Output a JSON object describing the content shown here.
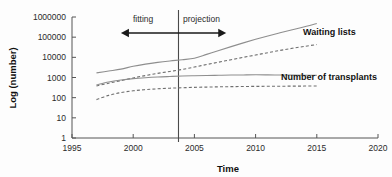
{
  "chart_data": {
    "type": "line",
    "title": "",
    "xlabel": "Time",
    "ylabel": "Log (number)",
    "xlim": [
      1995,
      2020
    ],
    "ylim": [
      1,
      1000000
    ],
    "yscale": "log",
    "grid": false,
    "legend_position": "inline-right",
    "xticks": [
      "1995",
      "2000",
      "2005",
      "2010",
      "2015",
      "2020"
    ],
    "yticks": [
      "1000000",
      "100000",
      "10000",
      "1000",
      "100",
      "10",
      "1"
    ],
    "annotations": [
      {
        "text": "fitting",
        "x": 2000.6,
        "y_label": "above-arrow"
      },
      {
        "text": "projection",
        "x": 2006.4,
        "y_label": "above-arrow"
      }
    ],
    "divider_x": 2003.7,
    "series": [
      {
        "name": "Waiting lists",
        "style": "solid",
        "label": "Waiting lists",
        "x": [
          1997,
          1998,
          1999,
          2000,
          2001,
          2002,
          2003,
          2004,
          2005,
          2006,
          2007,
          2008,
          2009,
          2010,
          2011,
          2012,
          2013,
          2014,
          2015
        ],
        "values": [
          1700,
          2100,
          2600,
          3600,
          4600,
          5600,
          6600,
          7600,
          9000,
          14000,
          22000,
          34000,
          52000,
          78000,
          115000,
          165000,
          235000,
          330000,
          480000
        ]
      },
      {
        "name": "Waiting lists projection",
        "style": "dashed",
        "label": "",
        "x": [
          1997,
          1998,
          1999,
          2000,
          2001,
          2002,
          2003,
          2004,
          2005,
          2006,
          2007,
          2008,
          2009,
          2010,
          2011,
          2012,
          2013,
          2014,
          2015
        ],
        "values": [
          380,
          520,
          700,
          950,
          1250,
          1600,
          2000,
          2500,
          3300,
          4400,
          5800,
          7600,
          10000,
          13000,
          17000,
          22000,
          28000,
          35000,
          43000
        ]
      },
      {
        "name": "Number of transplants",
        "style": "solid",
        "label": "Number of transplants",
        "x": [
          1997,
          1998,
          1999,
          2000,
          2001,
          2002,
          2003,
          2004,
          2005,
          2006,
          2007,
          2008,
          2009,
          2010,
          2011,
          2012,
          2013,
          2014,
          2015
        ],
        "values": [
          430,
          600,
          750,
          880,
          980,
          1060,
          1120,
          1180,
          1220,
          1260,
          1290,
          1320,
          1340,
          1360,
          1350,
          1330,
          1310,
          1290,
          1270
        ]
      },
      {
        "name": "Number of transplants projection",
        "style": "dashed",
        "label": "",
        "x": [
          1997,
          1998,
          1999,
          2000,
          2001,
          2002,
          2003,
          2004,
          2005,
          2006,
          2007,
          2008,
          2009,
          2010,
          2011,
          2012,
          2013,
          2014,
          2015
        ],
        "values": [
          80,
          130,
          180,
          220,
          250,
          275,
          295,
          310,
          325,
          335,
          345,
          352,
          358,
          363,
          367,
          370,
          373,
          376,
          378
        ]
      }
    ]
  },
  "labels": {
    "fitting": "fitting",
    "projection": "projection",
    "waiting_lists": "Waiting lists",
    "transplants": "Number of transplants",
    "x_axis_title": "Time",
    "y_axis_title": "Log (number)"
  }
}
